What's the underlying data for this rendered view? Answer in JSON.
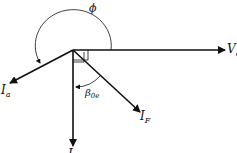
{
  "diagram": {
    "type": "phasor-diagram",
    "labels": {
      "phi": "ϕ",
      "va_main": "V",
      "va_sub": "a",
      "ia_main": "I",
      "ia_sub": "a",
      "if_main": "I",
      "if_sub": "F",
      "i": "I",
      "beta_main": "β",
      "beta_sub": "0e"
    },
    "colors": {
      "line": "#111111",
      "background": "#ffffff"
    }
  }
}
